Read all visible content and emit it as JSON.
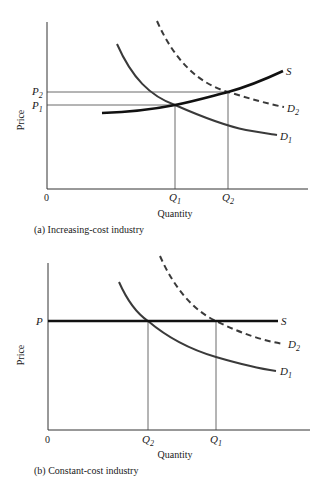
{
  "panels": [
    {
      "id": "a",
      "caption": "(a) Increasing-cost industry",
      "ylabel": "Price",
      "xlabel": "Quantity",
      "origin": "0",
      "price_labels": [
        {
          "base": "P",
          "sub": "2"
        },
        {
          "base": "P",
          "sub": "1"
        }
      ],
      "quantity_labels": [
        {
          "base": "Q",
          "sub": "1"
        },
        {
          "base": "Q",
          "sub": "2"
        }
      ],
      "curves": [
        {
          "name": "S",
          "type": "supply",
          "style": "solid-thick"
        },
        {
          "name": "D",
          "sub": "2",
          "type": "demand",
          "style": "dashed"
        },
        {
          "name": "D",
          "sub": "1",
          "type": "demand",
          "style": "solid"
        }
      ]
    },
    {
      "id": "b",
      "caption": "(b) Constant-cost industry",
      "ylabel": "Price",
      "xlabel": "Quantity",
      "origin": "0",
      "price_labels": [
        {
          "base": "P",
          "sub": ""
        }
      ],
      "quantity_labels": [
        {
          "base": "Q",
          "sub": "2"
        },
        {
          "base": "Q",
          "sub": "1"
        }
      ],
      "curves": [
        {
          "name": "S",
          "type": "supply",
          "style": "solid-thick horizontal"
        },
        {
          "name": "D",
          "sub": "2",
          "type": "demand",
          "style": "dashed"
        },
        {
          "name": "D",
          "sub": "1",
          "type": "demand",
          "style": "solid"
        }
      ]
    }
  ]
}
